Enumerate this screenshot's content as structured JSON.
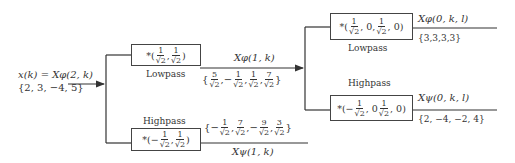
{
  "input": {
    "label": "x(k) = Xφ(2, k)",
    "values": "{2, 3, −4, 5}"
  },
  "level1": {
    "lowpass": {
      "filter": "*(1/√2, 1/√2)",
      "filter_prefix": "*(",
      "filter_suffix": ")",
      "coeffs": [
        {
          "num": "1",
          "den": "√2"
        },
        {
          "num": "1",
          "den": "√2"
        }
      ],
      "caption": "Lowpass",
      "output_label": "Xφ(1, k)",
      "output_values": [
        {
          "sign": "",
          "num": "5",
          "den": "√2"
        },
        {
          "sign": "−",
          "num": "1",
          "den": "√2"
        },
        {
          "sign": "",
          "num": "1",
          "den": "√2"
        },
        {
          "sign": "",
          "num": "7",
          "den": "√2"
        }
      ]
    },
    "highpass": {
      "filter": "*(−1/√2, 1/√2)",
      "caption": "Highpass",
      "coeffs": [
        {
          "sign": "−",
          "num": "1",
          "den": "√2"
        },
        {
          "sign": "",
          "num": "1",
          "den": "√2"
        }
      ],
      "output_label": "Xψ(1, k)",
      "output_values": [
        {
          "sign": "−",
          "num": "1",
          "den": "√2"
        },
        {
          "sign": "",
          "num": "7",
          "den": "√2"
        },
        {
          "sign": "−",
          "num": "9",
          "den": "√2"
        },
        {
          "sign": "",
          "num": "3",
          "den": "√2"
        }
      ]
    }
  },
  "level2": {
    "lowpass": {
      "filter": "*(1/√2, 0, 1/√2, 0)",
      "caption": "Lowpass",
      "output_label": "Xφ(0, k, l)",
      "output_values": "{3,3,3,3}"
    },
    "highpass": {
      "filter": "*(−1/√2, 0 1/√2, 0)",
      "caption": "Highpass",
      "output_label": "Xψ(0, k, l)",
      "output_values": "{2, −4, −2, 4}"
    }
  },
  "symbols": {
    "star_open": "*(",
    "close": ")",
    "comma": ",",
    "zero": "0",
    "brace_open": "{",
    "brace_close": "}"
  }
}
